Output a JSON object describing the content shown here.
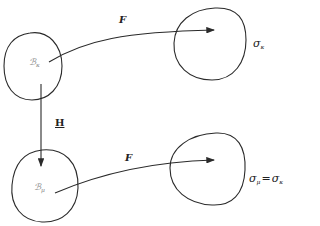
{
  "diagram": {
    "nodes": {
      "body_kappa": {
        "symbol": "ℬ",
        "subscript": "κ"
      },
      "body_mu": {
        "symbol": "ℬ",
        "subscript": "μ"
      },
      "stress_kappa": {
        "symbol": "σ",
        "subscript": "κ"
      },
      "stress_mu": {
        "symbol": "σ",
        "subscript": "μ",
        "equals": "=",
        "rhs_symbol": "σ",
        "rhs_subscript": "κ"
      }
    },
    "edges": {
      "top_map": {
        "label": "F"
      },
      "bottom_map": {
        "label": "F"
      },
      "vertical_map": {
        "label": "H"
      }
    },
    "colors": {
      "stroke": "#2a2a2a",
      "text": "#222222",
      "faint_label": "#888888"
    }
  }
}
